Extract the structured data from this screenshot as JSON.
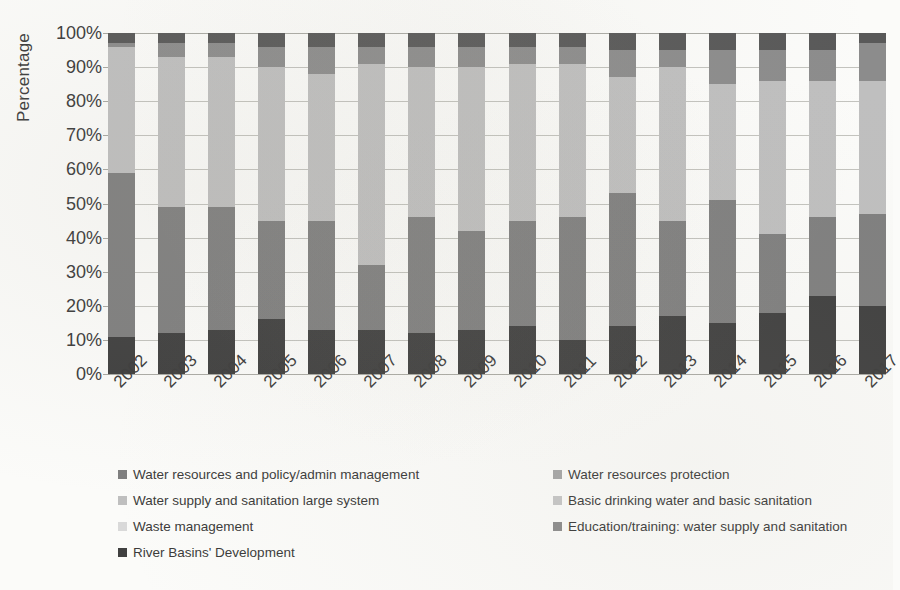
{
  "chart_data": {
    "type": "bar",
    "subtype": "stacked-100-percent",
    "title": "",
    "xlabel": "",
    "ylabel": "Percentage",
    "ylim": [
      0,
      100
    ],
    "grid": true,
    "legend_position": "bottom",
    "y_tick_labels": [
      "100%",
      "90%",
      "80%",
      "70%",
      "60%",
      "50%",
      "40%",
      "30%",
      "20%",
      "10%",
      "0%"
    ],
    "y_tick_values": [
      100,
      90,
      80,
      70,
      60,
      50,
      40,
      30,
      20,
      10,
      0
    ],
    "categories": [
      "2002",
      "2003",
      "2004",
      "2005",
      "2006",
      "2007",
      "2008",
      "2009",
      "2010",
      "2011",
      "2012",
      "2013",
      "2014",
      "2015",
      "2016",
      "2017"
    ],
    "series": [
      {
        "name": "Water resources and policy/admin management",
        "color": "#7f7f7f",
        "values": [
          48,
          37,
          34,
          29,
          30,
          17,
          34,
          30,
          32,
          42,
          37,
          27,
          35,
          23,
          23,
          27
        ]
      },
      {
        "name": "Water resources protection",
        "color": "#a6a6a6",
        "values": [
          0,
          0,
          0,
          0,
          0,
          0,
          0,
          0,
          0,
          0,
          0,
          0,
          0,
          0,
          0,
          0
        ]
      },
      {
        "name": "Water supply and sanitation large system",
        "color": "#bfbfbf",
        "values": [
          37,
          43,
          45,
          43,
          45,
          61,
          44,
          47,
          46,
          45,
          37,
          47,
          38,
          47,
          40,
          39
        ]
      },
      {
        "name": "Basic drinking water and basic sanitation",
        "color": "#8c8c8c",
        "values": [
          2,
          4,
          4,
          5,
          7,
          4,
          5,
          6,
          4,
          4,
          9,
          5,
          10,
          12,
          11,
          12
        ]
      },
      {
        "name": "Waste management",
        "color": "#d9d9d9",
        "values": [
          0,
          0,
          0,
          0,
          0,
          0,
          0,
          0,
          0,
          0,
          0,
          0,
          0,
          0,
          0,
          0
        ]
      },
      {
        "name": "Education/training: water supply and sanitation",
        "color": "#595959",
        "values": [
          0,
          0,
          0,
          0,
          0,
          0,
          0,
          0,
          0,
          0,
          0,
          0,
          0,
          0,
          0,
          0
        ]
      },
      {
        "name": "River Basins' Development",
        "color": "#404040",
        "values": [
          13,
          16,
          17,
          23,
          18,
          18,
          17,
          17,
          18,
          9,
          17,
          21,
          17,
          18,
          26,
          22
        ]
      }
    ],
    "stack_order_bottom_to_top": [
      "River Basins' Development",
      "Water resources and policy/admin management",
      "Water supply and sanitation large system",
      "Basic drinking water and basic sanitation",
      "Education/training: water supply and sanitation"
    ],
    "stacks": [
      {
        "year": "2002",
        "segments": [
          {
            "name": "River Basins' Development",
            "value": 11
          },
          {
            "name": "Water resources and policy/admin management",
            "value": 48
          },
          {
            "name": "Water supply and sanitation large system",
            "value": 37
          },
          {
            "name": "Basic drinking water and basic sanitation",
            "value": 1
          },
          {
            "name": "Education/training: water supply and sanitation",
            "value": 3
          }
        ]
      },
      {
        "year": "2003",
        "segments": [
          {
            "name": "River Basins' Development",
            "value": 12
          },
          {
            "name": "Water resources and policy/admin management",
            "value": 37
          },
          {
            "name": "Water supply and sanitation large system",
            "value": 44
          },
          {
            "name": "Basic drinking water and basic sanitation",
            "value": 4
          },
          {
            "name": "Education/training: water supply and sanitation",
            "value": 3
          }
        ]
      },
      {
        "year": "2004",
        "segments": [
          {
            "name": "River Basins' Development",
            "value": 13
          },
          {
            "name": "Water resources and policy/admin management",
            "value": 36
          },
          {
            "name": "Water supply and sanitation large system",
            "value": 44
          },
          {
            "name": "Basic drinking water and basic sanitation",
            "value": 4
          },
          {
            "name": "Education/training: water supply and sanitation",
            "value": 3
          }
        ]
      },
      {
        "year": "2005",
        "segments": [
          {
            "name": "River Basins' Development",
            "value": 16
          },
          {
            "name": "Water resources and policy/admin management",
            "value": 29
          },
          {
            "name": "Water supply and sanitation large system",
            "value": 45
          },
          {
            "name": "Basic drinking water and basic sanitation",
            "value": 6
          },
          {
            "name": "Education/training: water supply and sanitation",
            "value": 4
          }
        ]
      },
      {
        "year": "2006",
        "segments": [
          {
            "name": "River Basins' Development",
            "value": 13
          },
          {
            "name": "Water resources and policy/admin management",
            "value": 32
          },
          {
            "name": "Water supply and sanitation large system",
            "value": 43
          },
          {
            "name": "Basic drinking water and basic sanitation",
            "value": 8
          },
          {
            "name": "Education/training: water supply and sanitation",
            "value": 4
          }
        ]
      },
      {
        "year": "2007",
        "segments": [
          {
            "name": "River Basins' Development",
            "value": 13
          },
          {
            "name": "Water resources and policy/admin management",
            "value": 19
          },
          {
            "name": "Water supply and sanitation large system",
            "value": 59
          },
          {
            "name": "Basic drinking water and basic sanitation",
            "value": 5
          },
          {
            "name": "Education/training: water supply and sanitation",
            "value": 4
          }
        ]
      },
      {
        "year": "2008",
        "segments": [
          {
            "name": "River Basins' Development",
            "value": 12
          },
          {
            "name": "Water resources and policy/admin management",
            "value": 34
          },
          {
            "name": "Water supply and sanitation large system",
            "value": 44
          },
          {
            "name": "Basic drinking water and basic sanitation",
            "value": 6
          },
          {
            "name": "Education/training: water supply and sanitation",
            "value": 4
          }
        ]
      },
      {
        "year": "2009",
        "segments": [
          {
            "name": "River Basins' Development",
            "value": 13
          },
          {
            "name": "Water resources and policy/admin management",
            "value": 29
          },
          {
            "name": "Water supply and sanitation large system",
            "value": 48
          },
          {
            "name": "Basic drinking water and basic sanitation",
            "value": 6
          },
          {
            "name": "Education/training: water supply and sanitation",
            "value": 4
          }
        ]
      },
      {
        "year": "2010",
        "segments": [
          {
            "name": "River Basins' Development",
            "value": 14
          },
          {
            "name": "Water resources and policy/admin management",
            "value": 31
          },
          {
            "name": "Water supply and sanitation large system",
            "value": 46
          },
          {
            "name": "Basic drinking water and basic sanitation",
            "value": 5
          },
          {
            "name": "Education/training: water supply and sanitation",
            "value": 4
          }
        ]
      },
      {
        "year": "2011",
        "segments": [
          {
            "name": "River Basins' Development",
            "value": 10
          },
          {
            "name": "Water resources and policy/admin management",
            "value": 36
          },
          {
            "name": "Water supply and sanitation large system",
            "value": 45
          },
          {
            "name": "Basic drinking water and basic sanitation",
            "value": 5
          },
          {
            "name": "Education/training: water supply and sanitation",
            "value": 4
          }
        ]
      },
      {
        "year": "2012",
        "segments": [
          {
            "name": "River Basins' Development",
            "value": 14
          },
          {
            "name": "Water resources and policy/admin management",
            "value": 39
          },
          {
            "name": "Water supply and sanitation large system",
            "value": 34
          },
          {
            "name": "Basic drinking water and basic sanitation",
            "value": 8
          },
          {
            "name": "Education/training: water supply and sanitation",
            "value": 5
          }
        ]
      },
      {
        "year": "2013",
        "segments": [
          {
            "name": "River Basins' Development",
            "value": 17
          },
          {
            "name": "Water resources and policy/admin management",
            "value": 28
          },
          {
            "name": "Water supply and sanitation large system",
            "value": 45
          },
          {
            "name": "Basic drinking water and basic sanitation",
            "value": 5
          },
          {
            "name": "Education/training: water supply and sanitation",
            "value": 5
          }
        ]
      },
      {
        "year": "2014",
        "segments": [
          {
            "name": "River Basins' Development",
            "value": 15
          },
          {
            "name": "Water resources and policy/admin management",
            "value": 36
          },
          {
            "name": "Water supply and sanitation large system",
            "value": 34
          },
          {
            "name": "Basic drinking water and basic sanitation",
            "value": 10
          },
          {
            "name": "Education/training: water supply and sanitation",
            "value": 5
          }
        ]
      },
      {
        "year": "2015",
        "segments": [
          {
            "name": "River Basins' Development",
            "value": 18
          },
          {
            "name": "Water resources and policy/admin management",
            "value": 23
          },
          {
            "name": "Water supply and sanitation large system",
            "value": 45
          },
          {
            "name": "Basic drinking water and basic sanitation",
            "value": 9
          },
          {
            "name": "Education/training: water supply and sanitation",
            "value": 5
          }
        ]
      },
      {
        "year": "2016",
        "segments": [
          {
            "name": "River Basins' Development",
            "value": 23
          },
          {
            "name": "Water resources and policy/admin management",
            "value": 23
          },
          {
            "name": "Water supply and sanitation large system",
            "value": 40
          },
          {
            "name": "Basic drinking water and basic sanitation",
            "value": 9
          },
          {
            "name": "Education/training: water supply and sanitation",
            "value": 5
          }
        ]
      },
      {
        "year": "2017",
        "segments": [
          {
            "name": "River Basins' Development",
            "value": 20
          },
          {
            "name": "Water resources and policy/admin management",
            "value": 27
          },
          {
            "name": "Water supply and sanitation large system",
            "value": 39
          },
          {
            "name": "Basic drinking water and basic sanitation",
            "value": 11
          },
          {
            "name": "Education/training: water supply and sanitation",
            "value": 3
          }
        ]
      }
    ]
  },
  "legend": {
    "items": [
      {
        "label": "Water resources and policy/admin management",
        "color": "#7f7f7f",
        "column": "left",
        "row": 0
      },
      {
        "label": "Water supply and sanitation large system",
        "color": "#bfbfbf",
        "column": "left",
        "row": 1
      },
      {
        "label": "Waste management",
        "color": "#d9d9d9",
        "column": "left",
        "row": 2
      },
      {
        "label": "River Basins' Development",
        "color": "#404040",
        "column": "left",
        "row": 3
      },
      {
        "label": "Water resources protection",
        "color": "#a6a6a6",
        "column": "right",
        "row": 0
      },
      {
        "label": "Basic drinking water and basic sanitation",
        "color": "#c6c6c6",
        "column": "right",
        "row": 1
      },
      {
        "label": "Education/training: water supply and sanitation",
        "color": "#8c8c8c",
        "column": "right",
        "row": 2
      }
    ]
  },
  "colors": {
    "background": "#fbfbf9",
    "gridline": "#b9b9b4",
    "text": "#3b3b3b"
  }
}
